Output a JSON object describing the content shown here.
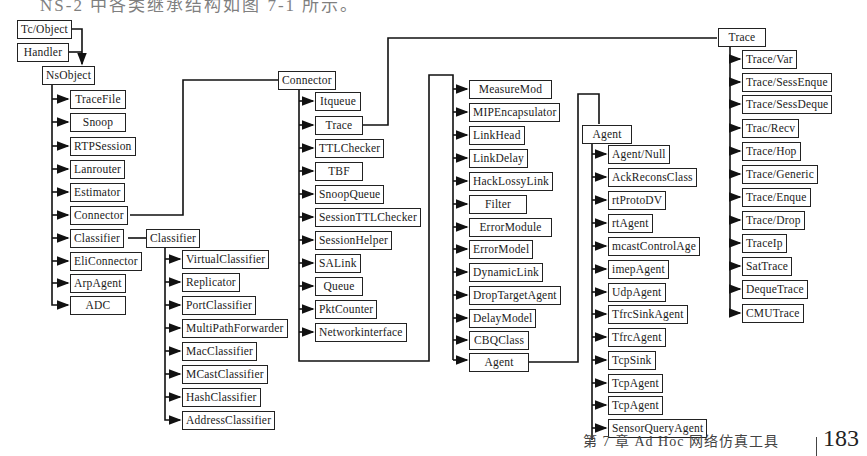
{
  "heading": "NS-2 中各类继承结构如图 7-1 所示。",
  "footer": {
    "chapter": "第 7 章   Ad Hoc 网络仿真工具",
    "page": "183"
  },
  "diagram": {
    "roots": [
      "Tc/Object",
      "Handler"
    ],
    "nsobject": {
      "label": "NsObject",
      "children": [
        "TraceFile",
        "Snoop",
        "RTPSession",
        "Lanrouter",
        "Estimator",
        "Connector",
        "Classifier",
        "EliConnector",
        "ArpAgent",
        "ADC"
      ]
    },
    "classifier": {
      "label": "Classifier",
      "children": [
        "VirtualClassifier",
        "Replicator",
        "PortClassifier",
        "MultiPathForwarder",
        "MacClassifier",
        "MCastClassifier",
        "HashClassifier",
        "AddressClassifier"
      ]
    },
    "connector": {
      "label": "Connector",
      "children": [
        "Itqueue",
        "Trace",
        "TTLChecker",
        "TBF",
        "SnoopQueue",
        "SessionTTLChecker",
        "SessionHelper",
        "SALink",
        "Queue",
        "PktCounter",
        "Networkinterface"
      ]
    },
    "connector_more": {
      "children": [
        "MeasureMod",
        "MIPEncapsulator",
        "LinkHead",
        "LinkDelay",
        "HackLossyLink",
        "Filter",
        "ErrorModule",
        "ErrorModel",
        "DynamicLink",
        "DropTargetAgent",
        "DelayModel",
        "CBQClass",
        "Agent"
      ]
    },
    "agent": {
      "label": "Agent",
      "children": [
        "Agent/Null",
        "AckReconsClass",
        "rtProtoDV",
        "rtAgent",
        "mcastControlAge",
        "imepAgent",
        "UdpAgent",
        "TfrcSinkAgent",
        "TfrcAgent",
        "TcpSink",
        "TcpAgent",
        "TcpAgent",
        "SensorQueryAgent"
      ]
    },
    "trace": {
      "label": "Trace",
      "children": [
        "Trace/Var",
        "Trace/SessEnque",
        "Trace/SessDeque",
        "Trac/Recv",
        "Trace/Hop",
        "Trace/Generic",
        "Trace/Enque",
        "Trace/Drop",
        "TraceIp",
        "SatTrace",
        "DequeTrace",
        "CMUTrace"
      ]
    }
  }
}
